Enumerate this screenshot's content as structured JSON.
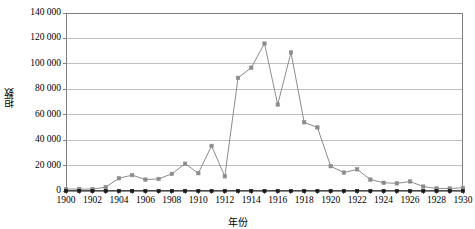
{
  "chart_data": {
    "type": "line",
    "title": "",
    "xlabel": "年份",
    "ylabel": "担数",
    "x": [
      1900,
      1901,
      1902,
      1903,
      1904,
      1905,
      1906,
      1907,
      1908,
      1909,
      1910,
      1911,
      1912,
      1913,
      1914,
      1915,
      1916,
      1917,
      1918,
      1919,
      1920,
      1921,
      1922,
      1923,
      1924,
      1925,
      1926,
      1927,
      1928,
      1929,
      1930
    ],
    "xtick_labels": [
      "1900",
      "1902",
      "1904",
      "1906",
      "1908",
      "1910",
      "1912",
      "1914",
      "1916",
      "1918",
      "1920",
      "1922",
      "1924",
      "1926",
      "1928",
      "1930"
    ],
    "xtick_values": [
      1900,
      1902,
      1904,
      1906,
      1908,
      1910,
      1912,
      1914,
      1916,
      1918,
      1920,
      1922,
      1924,
      1926,
      1928,
      1930
    ],
    "ytick_labels": [
      "0",
      "20 000",
      "40 000",
      "60 000",
      "80 000",
      "100 000",
      "120 000",
      "140 000"
    ],
    "ytick_values": [
      0,
      20000,
      40000,
      60000,
      80000,
      100000,
      120000,
      140000
    ],
    "xlim": [
      1900,
      1930
    ],
    "ylim": [
      0,
      140000
    ],
    "grid": "horizontal",
    "legend": "none",
    "series": [
      {
        "name": "担数",
        "color": "#8c8c8c",
        "marker": "square",
        "values": [
          1500,
          1500,
          1500,
          3000,
          10000,
          12500,
          9000,
          9500,
          13500,
          21500,
          14000,
          35500,
          11500,
          89000,
          97000,
          116000,
          68000,
          109000,
          54000,
          50000,
          19500,
          14500,
          17000,
          9000,
          6500,
          6000,
          7500,
          3500,
          2000,
          2000,
          2500
        ]
      },
      {
        "name": "baseline",
        "color": "#1a1a1a",
        "marker": "square",
        "values": [
          0,
          0,
          0,
          0,
          0,
          0,
          0,
          0,
          0,
          0,
          0,
          0,
          0,
          0,
          0,
          0,
          0,
          0,
          0,
          0,
          0,
          0,
          0,
          0,
          0,
          0,
          0,
          0,
          0,
          0,
          0
        ]
      }
    ]
  },
  "colors": {
    "plot_border": "#7f7f7f",
    "gridline": "#bfbfbf",
    "series_main": "#8c8c8c",
    "series_baseline": "#1a1a1a",
    "text": "#000000",
    "background": "#ffffff"
  }
}
